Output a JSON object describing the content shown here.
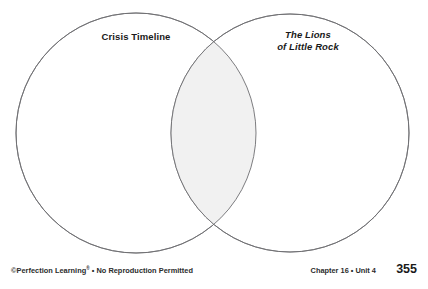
{
  "page": {
    "background_color": "#ffffff"
  },
  "diagram": {
    "type": "venn-diagram",
    "stroke_color": "#6e6e72",
    "overlap_fill_color": "#f1f1f1",
    "circle_fill_color": "#ffffff",
    "left_circle": {
      "label": "Crisis Timeline",
      "cx": 136,
      "cy": 133,
      "r": 120
    },
    "right_circle": {
      "label_line1": "The Lions",
      "label_line2": "of Little Rock",
      "cx": 290,
      "cy": 133,
      "r": 119
    }
  },
  "footer": {
    "copyright_prefix": "©Perfection Learning",
    "copyright_mark": "®",
    "copyright_suffix": " • No Reproduction Permitted",
    "chapter": "Chapter 16 • Unit 4",
    "page_number": "355"
  }
}
